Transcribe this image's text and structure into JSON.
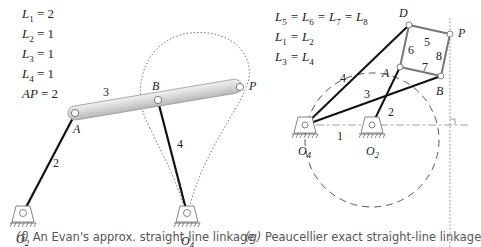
{
  "figure_f": {
    "equations": [
      {
        "sym": "L",
        "sub": "1",
        "rhs": "= 2"
      },
      {
        "sym": "L",
        "sub": "2",
        "rhs": "= 1"
      },
      {
        "sym": "L",
        "sub": "3",
        "rhs": "= 1"
      },
      {
        "sym": "L",
        "sub": "4",
        "rhs": "= 1"
      },
      {
        "sym": "AP",
        "sub": "",
        "rhs": "= 2"
      }
    ],
    "points": {
      "A": "A",
      "B": "B",
      "P": "P",
      "O2": "O",
      "O2_sub": "2",
      "O4": "O",
      "O4_sub": "4"
    },
    "links": {
      "l2": "2",
      "l3": "3",
      "l4": "4"
    },
    "caption_letter": "(f)",
    "caption_text": "An Evan's approx. straight-line linkage"
  },
  "figure_g": {
    "equations": [
      {
        "parts": [
          {
            "sym": "L",
            "sub": "5"
          },
          {
            "sym": "L",
            "sub": "6"
          },
          {
            "sym": "L",
            "sub": "7"
          },
          {
            "sym": "L",
            "sub": "8"
          }
        ]
      },
      {
        "parts": [
          {
            "sym": "L",
            "sub": "1"
          },
          {
            "sym": "L",
            "sub": "2"
          }
        ]
      },
      {
        "parts": [
          {
            "sym": "L",
            "sub": "3"
          },
          {
            "sym": "L",
            "sub": "4"
          }
        ]
      }
    ],
    "eq_line_1": "L5 = L6 = L7 = L8",
    "eq_line_2": "L1 = L2",
    "eq_line_3": "L3 = L4",
    "points": {
      "A": "A",
      "B": "B",
      "D": "D",
      "P": "P",
      "O2": "O",
      "O2_sub": "2",
      "O4": "O",
      "O4_sub": "4"
    },
    "links": {
      "l1": "1",
      "l2": "2",
      "l3": "3",
      "l4": "4",
      "l5": "5",
      "l6": "6",
      "l7": "7",
      "l8": "8"
    },
    "caption_letter": "(g)",
    "caption_text": "Peaucellier exact straight-line linkage"
  },
  "colors": {
    "link": "#111111",
    "coupler_fill": "#d9d9d9",
    "coupler_stroke": "#9a9a9a",
    "rhombus": "#777777",
    "curve": "#666666",
    "caption": "#555555"
  }
}
